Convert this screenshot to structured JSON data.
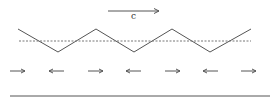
{
  "diagram": {
    "velocity_label": "c",
    "zigzag_points": [
      [
        18,
        29
      ],
      [
        58,
        52
      ],
      [
        96,
        29
      ],
      [
        134,
        52
      ],
      [
        172,
        29
      ],
      [
        210,
        52
      ],
      [
        251,
        29
      ]
    ],
    "mean_line": {
      "x1": 19,
      "x2": 251,
      "y": 41
    },
    "propagation_arrow": {
      "x1": 108,
      "x2": 159,
      "y": 11
    },
    "bottom_arrows": [
      {
        "x": 10,
        "dir": "right"
      },
      {
        "x": 49,
        "dir": "left"
      },
      {
        "x": 88,
        "dir": "right"
      },
      {
        "x": 126,
        "dir": "left"
      },
      {
        "x": 165,
        "dir": "right"
      },
      {
        "x": 203,
        "dir": "left"
      },
      {
        "x": 241,
        "dir": "right"
      }
    ],
    "baseline": {
      "x1": 10,
      "x2": 270,
      "y": 96
    },
    "colors": {
      "line": "#555555",
      "dashed": "#777777"
    }
  }
}
